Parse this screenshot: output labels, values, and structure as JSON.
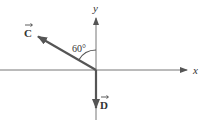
{
  "diagram": {
    "type": "vector-diagram",
    "axes": {
      "x_label": "x",
      "y_label": "y"
    },
    "vectors": [
      {
        "name": "C",
        "label": "C",
        "direction": "upper-left",
        "angle_from_positive_y_deg": 60
      },
      {
        "name": "D",
        "label": "D",
        "direction": "down (negative y)"
      }
    ],
    "angle_annotation": {
      "label": "60°",
      "between": [
        "C",
        "+y axis"
      ],
      "value_deg": 60
    },
    "colors": {
      "axis": "#555555",
      "vector_C": "#555555",
      "vector_D": "#555555",
      "text": "#333333",
      "background": "#ffffff"
    }
  }
}
